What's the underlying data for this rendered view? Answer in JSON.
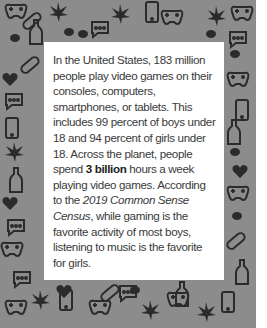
{
  "background": {
    "pattern_color": "#8c8c8c",
    "icon_color": "#2b2b2b",
    "icons": [
      "game-controller-icon",
      "leaf-icon",
      "smartphone-icon",
      "chat-bubble-icon",
      "bottle-icon",
      "pill-icon",
      "heart-icon",
      "cigarette-icon",
      "dice-icon"
    ]
  },
  "callout": {
    "text_before_bold": "In the United States, 183 million people play video games on their consoles, computers, smartphones, or tablets. This includes 99 percent of boys under 18 and 94 percent of girls under 18. Across the planet, people spend ",
    "bold": "3 billion",
    "text_after_bold": " hours a week playing video games. According to the ",
    "italic": "2019 Common Sense Census",
    "text_end": ", while gaming is the favorite activity of most boys, listening to music is the favorite for girls."
  }
}
